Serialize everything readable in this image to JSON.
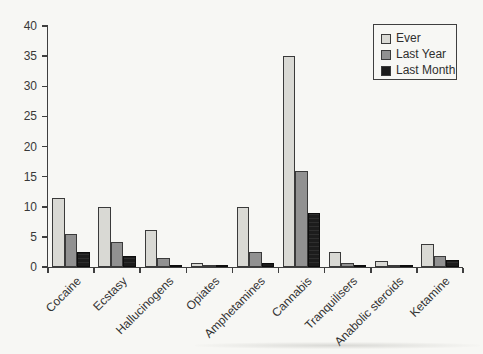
{
  "figure": {
    "background": "#f7f7f4",
    "axis_color": "#3f3f3f",
    "text_color": "#333333"
  },
  "chart_data": {
    "type": "bar",
    "title": "",
    "xlabel": "",
    "ylabel": "",
    "categories": [
      "Cocaine",
      "Ecstasy",
      "Hallucinogens",
      "Opiates",
      "Amphetamines",
      "Cannabis",
      "Tranquilisers",
      "Anabolic steroids",
      "Ketamine"
    ],
    "series": [
      {
        "name": "Ever",
        "color": "#d9d9d4",
        "values": [
          11.5,
          10.0,
          6.2,
          0.6,
          10.0,
          35.0,
          2.5,
          1.0,
          3.8
        ]
      },
      {
        "name": "Last Year",
        "color": "#919191",
        "values": [
          5.5,
          4.2,
          1.5,
          0.3,
          2.5,
          16.0,
          0.6,
          0.4,
          1.8
        ]
      },
      {
        "name": "Last Month",
        "color": "#1c1c1c",
        "values": [
          2.5,
          1.8,
          0.3,
          0.2,
          0.6,
          9.0,
          0.4,
          0.2,
          1.1
        ]
      }
    ],
    "ylim": [
      0,
      40
    ],
    "yticks": [
      0,
      5,
      10,
      15,
      20,
      25,
      30,
      35,
      40
    ],
    "grid": false,
    "legend_position": "top-right"
  }
}
